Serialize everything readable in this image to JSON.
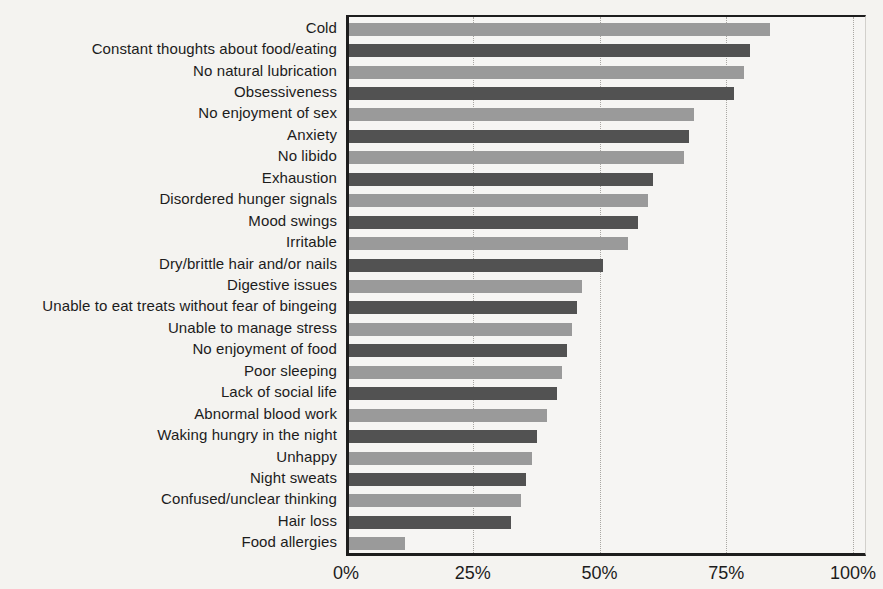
{
  "figure": {
    "background_color": "#f4f3f0",
    "axis_color": "#1d1d1d",
    "gridline_color": "#a9a7a3",
    "bar_color_light": "#9a9a9a",
    "bar_color_dark": "#525252"
  },
  "chart_data": {
    "type": "bar",
    "orientation": "horizontal",
    "title": "",
    "xlabel": "",
    "ylabel": "",
    "xlim": [
      0,
      100
    ],
    "x_tick_labels": [
      "0%",
      "25%",
      "50%",
      "75%",
      "100%"
    ],
    "x_tick_values": [
      0,
      25,
      50,
      75,
      100
    ],
    "grid": "vertical dotted gridlines at each x tick",
    "legend": "none",
    "bar_style": "bars alternate light gray and dark gray by row",
    "categories": [
      "Cold",
      "Constant thoughts about food/eating",
      "No natural lubrication",
      "Obsessiveness",
      "No enjoyment of sex",
      "Anxiety",
      "No libido",
      "Exhaustion",
      "Disordered hunger signals",
      "Mood swings",
      "Irritable",
      "Dry/brittle hair and/or nails",
      "Digestive issues",
      "Unable to eat treats without fear of bingeing",
      "Unable to manage stress",
      "No enjoyment of food",
      "Poor sleeping",
      "Lack of social life",
      "Abnormal blood work",
      "Waking hungry in the night",
      "Unhappy",
      "Night sweats",
      "Confused/unclear thinking",
      "Hair loss",
      "Food allergies"
    ],
    "values": [
      83,
      79,
      78,
      76,
      68,
      67,
      66,
      60,
      59,
      57,
      55,
      50,
      46,
      45,
      44,
      43,
      42,
      41,
      39,
      37,
      36,
      35,
      34,
      32,
      11
    ],
    "unit": "%"
  }
}
